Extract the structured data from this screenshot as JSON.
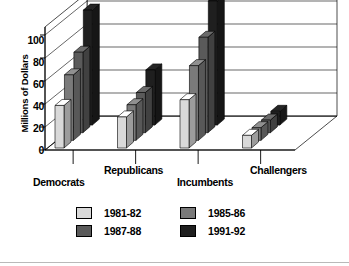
{
  "chart_data": {
    "type": "bar",
    "title": "",
    "subtitle": "",
    "xlabel": "",
    "ylabel": "Millions of Dollars",
    "ylim": [
      0,
      100
    ],
    "yticks": [
      0,
      20,
      40,
      60,
      80,
      100
    ],
    "grid": true,
    "projection": "3d-grouped-columns",
    "legend_position": "bottom",
    "categories": [
      "Democrats",
      "Republicans",
      "Incumbents",
      "Challengers"
    ],
    "series": [
      {
        "name": "1981-82",
        "color": "#d9d9d9",
        "values": [
          37,
          27,
          42,
          11
        ]
      },
      {
        "name": "1985-86",
        "color": "#7a7a7a",
        "values": [
          57,
          31,
          65,
          11
        ]
      },
      {
        "name": "1987-88",
        "color": "#5a5a5a",
        "values": [
          70,
          35,
          83,
          11
        ]
      },
      {
        "name": "1991-92",
        "color": "#1f1f1f",
        "values": [
          100,
          48,
          108,
          12
        ]
      }
    ]
  },
  "axis": {
    "y_title": "Millions of Dollars",
    "ticks": [
      "100",
      "80",
      "60",
      "40",
      "20",
      "0"
    ]
  },
  "categories": {
    "democrats": "Democrats",
    "republicans": "Republicans",
    "incumbents": "Incumbents",
    "challengers": "Challengers"
  },
  "legend": {
    "items": [
      {
        "label": "1981-82",
        "color": "#d9d9d9"
      },
      {
        "label": "1985-86",
        "color": "#7a7a7a"
      },
      {
        "label": "1987-88",
        "color": "#5a5a5a"
      },
      {
        "label": "1991-92",
        "color": "#1f1f1f"
      }
    ]
  }
}
